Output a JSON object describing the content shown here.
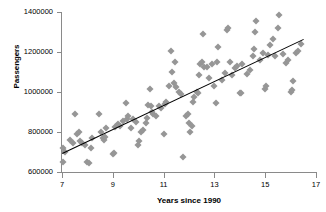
{
  "chart_data": {
    "type": "scatter",
    "title": "",
    "xlabel": "Years since 1990",
    "ylabel": "Passengers",
    "xlim": [
      7,
      17
    ],
    "ylim": [
      600000,
      1400000
    ],
    "xticks": [
      7,
      9,
      11,
      13,
      15,
      17
    ],
    "yticks": [
      600000,
      800000,
      1000000,
      1200000,
      1400000
    ],
    "xtick_labels": [
      "7",
      "9",
      "11",
      "13",
      "15",
      "17"
    ],
    "ytick_labels": [
      "600000",
      "800000",
      "1000000",
      "1200000",
      "1400000"
    ],
    "grid": false,
    "legend": false,
    "marker": "diamond",
    "marker_color": "#969696",
    "trendline": {
      "type": "linear",
      "color": "#000000",
      "x_start": 7.0,
      "y_start": 695000,
      "x_end": 16.5,
      "y_end": 1265000,
      "slope": 60000,
      "intercept": 275000
    },
    "points": [
      [
        7.02,
        718000
      ],
      [
        7.05,
        650000
      ],
      [
        7.1,
        700000
      ],
      [
        7.3,
        760000
      ],
      [
        7.45,
        745000
      ],
      [
        7.5,
        890000
      ],
      [
        7.6,
        790000
      ],
      [
        7.65,
        800000
      ],
      [
        7.7,
        755000
      ],
      [
        7.8,
        745000
      ],
      [
        7.9,
        735000
      ],
      [
        8.0,
        650000
      ],
      [
        8.08,
        645000
      ],
      [
        8.15,
        720000
      ],
      [
        8.2,
        770000
      ],
      [
        8.45,
        890000
      ],
      [
        8.55,
        800000
      ],
      [
        8.6,
        770000
      ],
      [
        8.65,
        760000
      ],
      [
        8.7,
        775000
      ],
      [
        8.75,
        820000
      ],
      [
        9.0,
        690000
      ],
      [
        9.05,
        695000
      ],
      [
        9.1,
        825000
      ],
      [
        9.2,
        840000
      ],
      [
        9.3,
        830000
      ],
      [
        9.4,
        855000
      ],
      [
        9.5,
        945000
      ],
      [
        9.55,
        865000
      ],
      [
        9.6,
        880000
      ],
      [
        9.7,
        820000
      ],
      [
        9.8,
        865000
      ],
      [
        9.9,
        850000
      ],
      [
        10.0,
        735000
      ],
      [
        10.05,
        755000
      ],
      [
        10.1,
        800000
      ],
      [
        10.2,
        810000
      ],
      [
        10.3,
        845000
      ],
      [
        10.35,
        870000
      ],
      [
        10.4,
        935000
      ],
      [
        10.45,
        1015000
      ],
      [
        10.5,
        930000
      ],
      [
        10.55,
        900000
      ],
      [
        10.6,
        890000
      ],
      [
        10.7,
        880000
      ],
      [
        10.8,
        930000
      ],
      [
        10.9,
        920000
      ],
      [
        11.0,
        790000
      ],
      [
        11.05,
        940000
      ],
      [
        11.1,
        950000
      ],
      [
        11.2,
        1030000
      ],
      [
        11.3,
        1205000
      ],
      [
        11.35,
        1100000
      ],
      [
        11.4,
        1045000
      ],
      [
        11.45,
        1150000
      ],
      [
        11.5,
        1025000
      ],
      [
        11.6,
        1000000
      ],
      [
        11.7,
        990000
      ],
      [
        11.75,
        675000
      ],
      [
        11.9,
        880000
      ],
      [
        11.95,
        890000
      ],
      [
        12.0,
        845000
      ],
      [
        12.05,
        800000
      ],
      [
        12.1,
        830000
      ],
      [
        12.15,
        950000
      ],
      [
        12.2,
        975000
      ],
      [
        12.3,
        1000000
      ],
      [
        12.35,
        995000
      ],
      [
        12.4,
        1085000
      ],
      [
        12.45,
        1140000
      ],
      [
        12.5,
        1150000
      ],
      [
        12.55,
        1290000
      ],
      [
        12.6,
        1125000
      ],
      [
        12.7,
        1125000
      ],
      [
        12.8,
        1070000
      ],
      [
        12.9,
        1140000
      ],
      [
        13.0,
        1030000
      ],
      [
        13.05,
        945000
      ],
      [
        13.1,
        1150000
      ],
      [
        13.15,
        1225000
      ],
      [
        13.3,
        1060000
      ],
      [
        13.4,
        1095000
      ],
      [
        13.5,
        1310000
      ],
      [
        13.55,
        1320000
      ],
      [
        13.6,
        1150000
      ],
      [
        13.7,
        1085000
      ],
      [
        13.8,
        1120000
      ],
      [
        13.9,
        1130000
      ],
      [
        14.0,
        995000
      ],
      [
        14.05,
        995000
      ],
      [
        14.1,
        1140000
      ],
      [
        14.3,
        1090000
      ],
      [
        14.4,
        1110000
      ],
      [
        14.5,
        1180000
      ],
      [
        14.55,
        1215000
      ],
      [
        14.6,
        1300000
      ],
      [
        14.65,
        1355000
      ],
      [
        14.8,
        1160000
      ],
      [
        14.9,
        1195000
      ],
      [
        15.0,
        1015000
      ],
      [
        15.05,
        1030000
      ],
      [
        15.1,
        1185000
      ],
      [
        15.2,
        1235000
      ],
      [
        15.3,
        1265000
      ],
      [
        15.4,
        1180000
      ],
      [
        15.5,
        1320000
      ],
      [
        15.55,
        1385000
      ],
      [
        15.7,
        1190000
      ],
      [
        15.8,
        1145000
      ],
      [
        15.9,
        1160000
      ],
      [
        16.0,
        1000000
      ],
      [
        16.05,
        1010000
      ],
      [
        16.1,
        1055000
      ],
      [
        16.2,
        1195000
      ],
      [
        16.3,
        1205000
      ],
      [
        16.4,
        1240000
      ]
    ]
  }
}
